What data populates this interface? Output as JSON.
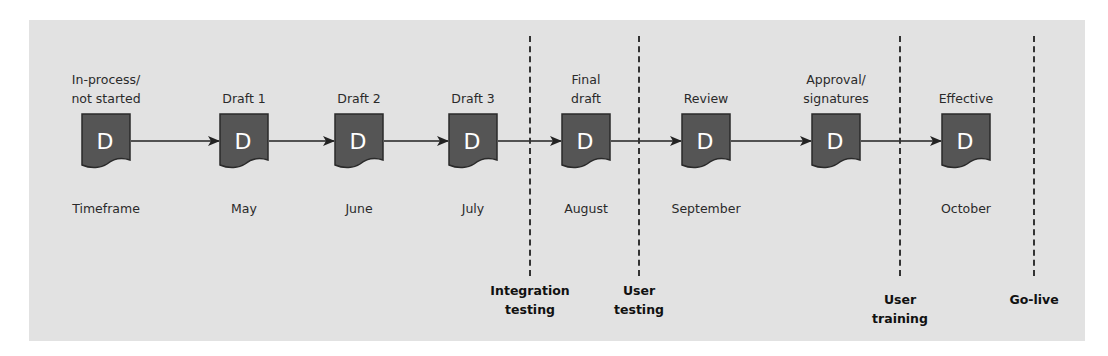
{
  "diagram": {
    "title": "",
    "colors": {
      "panel": "#e2e2e2",
      "document_fill": "#555555",
      "document_stroke": "#2a2a2a",
      "line": "#222222",
      "letter": "#ffffff"
    },
    "document_letter": "D",
    "stages": [
      {
        "top_label": [
          "In-process/",
          "not started"
        ],
        "timeframe": "Timeframe",
        "icon": "document-icon",
        "x": 106
      },
      {
        "top_label": [
          "Draft 1"
        ],
        "timeframe": "May",
        "icon": "document-icon",
        "x": 244
      },
      {
        "top_label": [
          "Draft 2"
        ],
        "timeframe": "June",
        "icon": "document-icon",
        "x": 359
      },
      {
        "top_label": [
          "Draft 3"
        ],
        "timeframe": "July",
        "icon": "document-icon",
        "x": 473
      },
      {
        "top_label": [
          "Final",
          "draft"
        ],
        "timeframe": "August",
        "icon": "document-icon",
        "x": 586
      },
      {
        "top_label": [
          "Review"
        ],
        "timeframe": "September",
        "icon": "document-icon",
        "x": 706
      },
      {
        "top_label": [
          "Approval/",
          "signatures"
        ],
        "timeframe": "",
        "icon": "document-icon",
        "x": 836
      },
      {
        "top_label": [
          "Effective"
        ],
        "timeframe": "October",
        "icon": "document-icon",
        "x": 966
      }
    ],
    "milestones": [
      {
        "label": [
          "Integration",
          "testing"
        ],
        "x": 530
      },
      {
        "label": [
          "User",
          "testing"
        ],
        "x": 639
      },
      {
        "label": [
          "User",
          "training"
        ],
        "x": 900
      },
      {
        "label": [
          "Go-live"
        ],
        "x": 1034
      }
    ]
  }
}
